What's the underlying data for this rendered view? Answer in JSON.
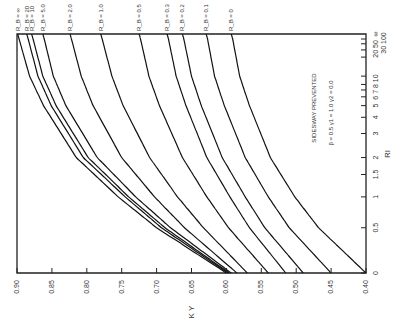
{
  "chart_data": {
    "type": "line",
    "orientation": "rotated 90 degrees (K_y axis along bottom, decreasing left to right; R_I axis along right side)",
    "title": "",
    "xlabel": "K_Y",
    "ylabel": "R_I",
    "annotation": {
      "line1": "SIDESWAY PREVENTED",
      "line2": "β = 0.5   γ1 = 1.0   γ2 = 0.0"
    },
    "ky_axis": {
      "range": [
        0.9,
        0.4
      ],
      "ticks": [
        "0.90",
        "0.85",
        "0.80",
        "0.75",
        "0.70",
        "0.65",
        "0.60",
        "0.55",
        "0.50",
        "0.45",
        "0.40"
      ]
    },
    "ri_axis": {
      "scale": "nonlinear R/(R+a)",
      "ticks": [
        "0",
        "0.5",
        "1",
        "1.5",
        "2",
        "3",
        "4",
        "5",
        "6",
        "7",
        "8",
        "10",
        "20",
        "30",
        "50",
        "100",
        "∞"
      ],
      "tick_labels": [
        "0",
        "0.5",
        "1",
        "1.5",
        "2",
        "3",
        "4",
        "5 6 7 8 10",
        "20 50",
        "30 100",
        "∞"
      ]
    },
    "grid": false,
    "legend_position": "curve labels along top edge",
    "x_RI": [
      0,
      0.5,
      1,
      2,
      5,
      10,
      100,
      "∞"
    ],
    "series": [
      {
        "name": "R_B = ∞",
        "label": "R_B = ∞",
        "values": [
          0.6,
          0.7,
          0.755,
          0.815,
          0.862,
          0.882,
          0.897,
          0.899
        ]
      },
      {
        "name": "R_B = 20",
        "label": "R_B = 20",
        "values": [
          0.598,
          0.693,
          0.745,
          0.805,
          0.851,
          0.87,
          0.884,
          0.886
        ]
      },
      {
        "name": "R_B = 10",
        "label": "R_B = 10",
        "values": [
          0.596,
          0.688,
          0.74,
          0.798,
          0.844,
          0.863,
          0.877,
          0.879
        ]
      },
      {
        "name": "R_B = 5.0",
        "label": "R_B = 5.0",
        "values": [
          0.593,
          0.68,
          0.73,
          0.785,
          0.83,
          0.848,
          0.861,
          0.863
        ]
      },
      {
        "name": "R_B = 2.0",
        "label": "R_B = 2.0",
        "values": [
          0.585,
          0.66,
          0.703,
          0.75,
          0.791,
          0.808,
          0.822,
          0.824
        ]
      },
      {
        "name": "R_B = 1.0",
        "label": "R_B = 1.0",
        "values": [
          0.57,
          0.633,
          0.67,
          0.71,
          0.748,
          0.764,
          0.778,
          0.78
        ]
      },
      {
        "name": "R_B = 0.5",
        "label": "R_B = 0.5",
        "values": [
          0.54,
          0.597,
          0.628,
          0.663,
          0.696,
          0.711,
          0.723,
          0.725
        ]
      },
      {
        "name": "R_B = 0.3",
        "label": "R_B = 0.3",
        "values": [
          0.515,
          0.567,
          0.595,
          0.628,
          0.658,
          0.672,
          0.683,
          0.685
        ]
      },
      {
        "name": "R_B = 0.2",
        "label": "R_B = 0.2",
        "values": [
          0.49,
          0.545,
          0.573,
          0.606,
          0.636,
          0.65,
          0.661,
          0.663
        ]
      },
      {
        "name": "R_B = 0.1",
        "label": "R_B = 0.1",
        "values": [
          0.45,
          0.51,
          0.54,
          0.573,
          0.603,
          0.617,
          0.627,
          0.629
        ]
      },
      {
        "name": "R_B = 0",
        "label": "R_B = 0",
        "values": [
          0.4,
          0.468,
          0.502,
          0.537,
          0.567,
          0.581,
          0.591,
          0.593
        ]
      }
    ]
  }
}
